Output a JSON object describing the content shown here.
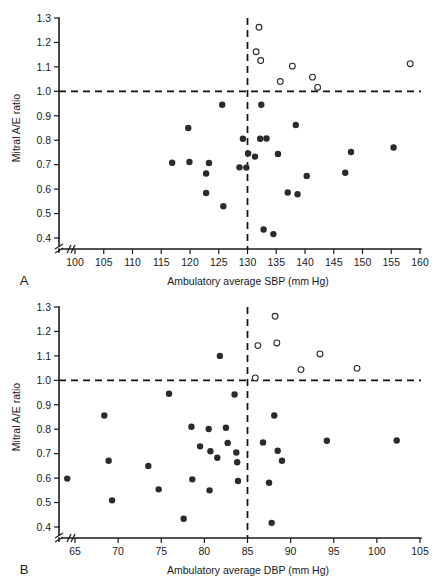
{
  "figure": {
    "panels": [
      {
        "letter": "A",
        "xlabel": "Ambulatory average SBP (mm Hg)",
        "ylabel": "Mitral A/E ratio"
      },
      {
        "letter": "B",
        "xlabel": "Ambulatory average DBP (mm Hg)",
        "ylabel": "Mitral A/E ratio"
      }
    ]
  },
  "colors": {
    "marker_filled": "#2b2b2b",
    "marker_open_stroke": "#2b2b2b",
    "marker_open_fill": "#ffffff",
    "axis": "#1a1a1a",
    "reference_line": "#111111",
    "background": "#ffffff"
  },
  "chart_data": [
    {
      "type": "scatter",
      "panel": "A",
      "title": "",
      "xlabel": "Ambulatory average SBP (mm Hg)",
      "ylabel": "Mitral A/E ratio",
      "xlim": [
        98,
        160
      ],
      "ylim": [
        0.37,
        1.3
      ],
      "xticks": [
        100,
        105,
        110,
        115,
        120,
        125,
        130,
        135,
        140,
        145,
        150,
        155,
        160
      ],
      "yticks": [
        0.4,
        0.5,
        0.6,
        0.7,
        0.8,
        0.9,
        1.0,
        1.1,
        1.2,
        1.3
      ],
      "xtick_labels": [
        "100",
        "105",
        "110",
        "115",
        "120",
        "125",
        "130",
        "135",
        "140",
        "145",
        "150",
        "155",
        "160"
      ],
      "ytick_labels": [
        "0.4",
        "0.5",
        "0.6",
        "0.7",
        "0.8",
        "0.9",
        "1.0",
        "1.1",
        "1.2",
        "1.3"
      ],
      "grid": false,
      "legend": "none",
      "axis_break": {
        "x": true,
        "y": true
      },
      "reference_lines": [
        {
          "orientation": "horizontal",
          "value": 1.0,
          "style": "dashed"
        },
        {
          "orientation": "vertical",
          "value": 130,
          "style": "dashed"
        }
      ],
      "series": [
        {
          "name": "Normal A/E ratio",
          "marker": "filled-circle",
          "points": [
            [
              116.9,
              0.708
            ],
            [
              119.7,
              0.85
            ],
            [
              119.9,
              0.711
            ],
            [
              122.8,
              0.664
            ],
            [
              122.8,
              0.584
            ],
            [
              123.3,
              0.707
            ],
            [
              125.6,
              0.945
            ],
            [
              125.8,
              0.53
            ],
            [
              128.6,
              0.689
            ],
            [
              129.2,
              0.806
            ],
            [
              129.8,
              0.688
            ],
            [
              130.1,
              0.746
            ],
            [
              131.3,
              0.733
            ],
            [
              132.2,
              0.806
            ],
            [
              132.4,
              0.945
            ],
            [
              132.8,
              0.435
            ],
            [
              133.3,
              0.807
            ],
            [
              134.5,
              0.416
            ],
            [
              135.3,
              0.744
            ],
            [
              137.0,
              0.586
            ],
            [
              138.4,
              0.862
            ],
            [
              138.7,
              0.579
            ],
            [
              140.3,
              0.654
            ],
            [
              147.0,
              0.667
            ],
            [
              148.0,
              0.752
            ],
            [
              155.4,
              0.77
            ]
          ]
        },
        {
          "name": "Elevated A/E ratio",
          "marker": "open-circle",
          "points": [
            [
              131.5,
              1.162
            ],
            [
              132.0,
              1.262
            ],
            [
              132.3,
              1.126
            ],
            [
              135.7,
              1.04
            ],
            [
              137.8,
              1.103
            ],
            [
              141.3,
              1.058
            ],
            [
              142.2,
              1.016
            ],
            [
              158.3,
              1.113
            ]
          ]
        }
      ]
    },
    {
      "type": "scatter",
      "panel": "B",
      "title": "",
      "xlabel": "Ambulatory average DBP (mm Hg)",
      "ylabel": "Mitral A/E ratio",
      "xlim": [
        63,
        105.5
      ],
      "ylim": [
        0.37,
        1.3
      ],
      "xticks": [
        65,
        70,
        75,
        80,
        85,
        90,
        95,
        100,
        105
      ],
      "yticks": [
        0.4,
        0.5,
        0.6,
        0.7,
        0.8,
        0.9,
        1.0,
        1.1,
        1.2,
        1.3
      ],
      "xtick_labels": [
        "65",
        "70",
        "75",
        "80",
        "85",
        "90",
        "95",
        "100",
        "105"
      ],
      "ytick_labels": [
        "0.4",
        "0.5",
        "0.6",
        "0.7",
        "0.8",
        "0.9",
        "1.0",
        "1.1",
        "1.2",
        "1.3"
      ],
      "grid": false,
      "legend": "none",
      "axis_break": {
        "x": true,
        "y": true
      },
      "reference_lines": [
        {
          "orientation": "horizontal",
          "value": 1.0,
          "style": "dashed"
        },
        {
          "orientation": "vertical",
          "value": 85,
          "style": "dashed"
        }
      ],
      "series": [
        {
          "name": "Normal A/E ratio",
          "marker": "filled-circle",
          "points": [
            [
              64.1,
              0.598
            ],
            [
              68.4,
              0.856
            ],
            [
              68.9,
              0.671
            ],
            [
              69.3,
              0.509
            ],
            [
              73.5,
              0.65
            ],
            [
              74.7,
              0.554
            ],
            [
              75.9,
              0.945
            ],
            [
              77.6,
              0.434
            ],
            [
              78.5,
              0.81
            ],
            [
              78.6,
              0.595
            ],
            [
              79.5,
              0.73
            ],
            [
              80.5,
              0.801
            ],
            [
              80.6,
              0.55
            ],
            [
              80.7,
              0.71
            ],
            [
              81.5,
              0.683
            ],
            [
              81.8,
              1.1
            ],
            [
              82.5,
              0.806
            ],
            [
              82.7,
              0.744
            ],
            [
              83.5,
              0.942
            ],
            [
              83.7,
              0.705
            ],
            [
              83.8,
              0.665
            ],
            [
              83.9,
              0.588
            ],
            [
              86.8,
              0.746
            ],
            [
              87.5,
              0.581
            ],
            [
              87.8,
              0.417
            ],
            [
              88.1,
              0.856
            ],
            [
              88.5,
              0.712
            ],
            [
              89.0,
              0.671
            ],
            [
              94.2,
              0.753
            ],
            [
              102.3,
              0.754
            ]
          ]
        },
        {
          "name": "Elevated A/E ratio",
          "marker": "open-circle",
          "points": [
            [
              85.9,
              1.01
            ],
            [
              86.2,
              1.142
            ],
            [
              88.2,
              1.262
            ],
            [
              88.4,
              1.153
            ],
            [
              91.2,
              1.044
            ],
            [
              93.4,
              1.108
            ],
            [
              97.7,
              1.049
            ]
          ]
        }
      ]
    }
  ]
}
